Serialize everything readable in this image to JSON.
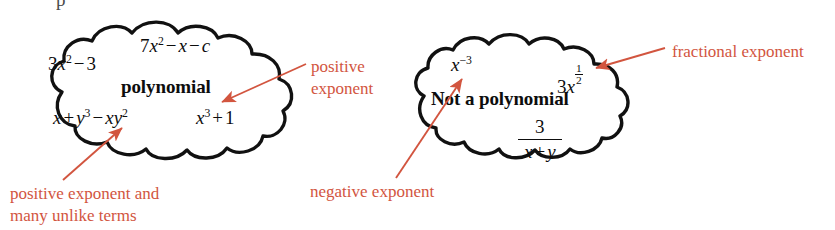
{
  "figure": {
    "kind": "concept-diagram",
    "background_color": "#ffffff",
    "ink_color": "#0d0d0d",
    "annotation_color": "#d2553f",
    "top_clipped_glyph": "p"
  },
  "clouds": [
    {
      "id": "polynomial-cloud",
      "label": "polynomial",
      "expressions": [
        {
          "id": "expr-3x2-3",
          "plain": "3x^2 - 3"
        },
        {
          "id": "expr-7x2-x-c",
          "plain": "7x^2 - x - c"
        },
        {
          "id": "expr-x-y3-xy2",
          "plain": "x + y^3 - xy^2"
        },
        {
          "id": "expr-x3-1",
          "plain": "x^3 + 1"
        }
      ]
    },
    {
      "id": "not-polynomial-cloud",
      "label": "Not a polynomial",
      "expressions": [
        {
          "id": "expr-x-neg3",
          "plain": "x^-3"
        },
        {
          "id": "expr-3x-half",
          "plain": "3x^(1/2)"
        },
        {
          "id": "expr-3-over-x-y",
          "plain": "3/(x + y)"
        }
      ]
    }
  ],
  "math": {
    "three": "3",
    "seven": "7",
    "one": "1",
    "x": "x",
    "y": "y",
    "c": "c",
    "xy": "xy",
    "minus": "−",
    "plus": "+",
    "exp2": "2",
    "exp3": "3",
    "exp_neg3": "−3",
    "frac_num_1": "1",
    "frac_den_2": "2",
    "frac_num_3": "3"
  },
  "annotations": [
    {
      "id": "annotation-positive-exponent",
      "lines": [
        "positive",
        "exponent"
      ],
      "points_at": "expr-x3-1",
      "arrow": "leader-and-arrowhead"
    },
    {
      "id": "annotation-positive-exponent-unlike-terms",
      "lines": [
        "positive exponent and",
        "many unlike terms"
      ],
      "points_at": "expr-x-y3-xy2",
      "arrow": "arrowhead"
    },
    {
      "id": "annotation-fractional-exponent",
      "lines": [
        "fractional exponent"
      ],
      "points_at": "expr-3x-half",
      "arrow": "leader-and-arrowhead"
    },
    {
      "id": "annotation-negative-exponent",
      "lines": [
        "negative exponent"
      ],
      "points_at": "expr-x-neg3",
      "arrow": "arrowhead"
    }
  ]
}
